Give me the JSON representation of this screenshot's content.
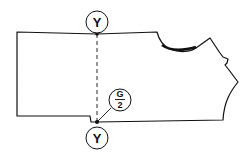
{
  "diagram": {
    "type": "sewing-pattern-piece",
    "labels": {
      "top_marker": "Y",
      "bottom_marker": "Y",
      "fraction_numerator": "G",
      "fraction_denominator": "2"
    },
    "colors": {
      "line": "#111111",
      "background": "#ffffff"
    }
  }
}
